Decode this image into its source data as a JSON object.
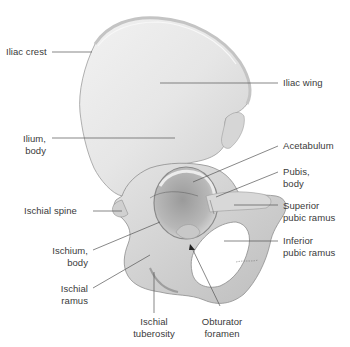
{
  "figure": {
    "colors": {
      "background": "#ffffff",
      "bone_light": "#ececec",
      "bone_mid": "#d2d2d2",
      "bone_shadow": "#a8a8a8",
      "leader_line": "#555555",
      "label_text": "#3a3a3a"
    }
  },
  "labels": {
    "iliac_crest": "Iliac crest",
    "iliac_wing": "Iliac wing",
    "ilium_body": "Ilium,\nbody",
    "acetabulum": "Acetabulum",
    "pubis_body": "Pubis,\nbody",
    "ischial_spine": "Ischial spine",
    "superior_pubic_ramus": "Superior\npubic ramus",
    "ischium_body": "Ischium,\nbody",
    "inferior_pubic_ramus": "Inferior\npubic ramus",
    "ischial_ramus": "Ischial\nramus",
    "ischial_tuberosity": "Ischial\ntuberosity",
    "obturator_foramen": "Obturator\nforamen"
  }
}
